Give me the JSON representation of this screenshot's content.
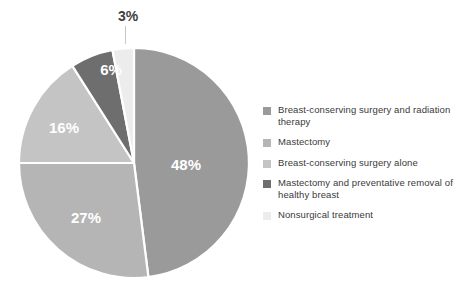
{
  "chart_data": {
    "type": "pie",
    "title": "",
    "categories": [
      "Breast-conserving surgery and radiation therapy",
      "Mastectomy",
      "Breast-conserving surgery alone",
      "Mastectomy and preventative removal of healthy breast",
      "Nonsurgical treatment"
    ],
    "values": [
      48,
      27,
      16,
      6,
      3
    ],
    "value_labels": [
      "48%",
      "27%",
      "16%",
      "6%",
      "3%"
    ],
    "colors": [
      "#9a9a9a",
      "#b5b5b5",
      "#c4c4c4",
      "#6e6e6e",
      "#ececec"
    ],
    "start_angle_deg": 0,
    "direction": "clockwise",
    "legend_position": "right",
    "grid": false,
    "separator_color": "#ffffff",
    "external_labels": [
      "3%"
    ]
  },
  "legend": {
    "items": [
      {
        "label": "Breast-conserving surgery and radiation therapy",
        "color": "#9a9a9a"
      },
      {
        "label": "Mastectomy",
        "color": "#b5b5b5"
      },
      {
        "label": "Breast-conserving surgery alone",
        "color": "#c4c4c4"
      },
      {
        "label": "Mastectomy and preventative removal of healthy breast",
        "color": "#6e6e6e"
      },
      {
        "label": "Nonsurgical treatment",
        "color": "#ececec"
      }
    ]
  },
  "labels": {
    "slice_0": "48%",
    "slice_1": "27%",
    "slice_2": "16%",
    "slice_3": "6%",
    "slice_4": "3%"
  }
}
